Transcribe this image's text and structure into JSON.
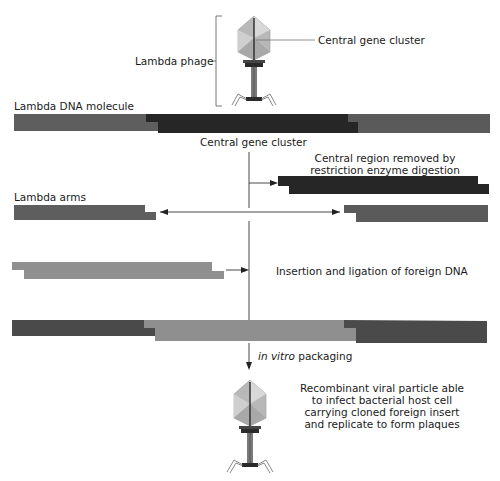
{
  "colors": {
    "arm": "#5a5a5a",
    "central": "#262626",
    "foreign": "#8f8f8f",
    "line": "#333333",
    "phage_head": "#b5b5b5",
    "phage_head_light": "#d6d6d6",
    "phage_dark": "#2a2a2a"
  },
  "labels": {
    "lambda_phage": "Lambda phage",
    "central_gene_cluster_top": "Central gene cluster",
    "lambda_dna_molecule": "Lambda DNA molecule",
    "central_gene_cluster_below": "Central gene cluster",
    "central_region_removed_line1": "Central region removed by",
    "central_region_removed_line2": "restriction enzyme digestion",
    "lambda_arms": "Lambda arms",
    "insertion_ligation": "Insertion and ligation of foreign DNA",
    "in_vitro": "in vitro",
    "packaging": " packaging",
    "recombinant_line1": "Recombinant viral particle able",
    "recombinant_line2": "to infect bacterial host cell",
    "recombinant_line3": "carrying cloned foreign insert",
    "recombinant_line4": "and replicate to form plaques"
  },
  "steps": [
    "Lambda DNA molecule",
    "Central region removed by restriction enzyme digestion",
    "Lambda arms",
    "Insertion and ligation of foreign DNA",
    "in vitro packaging",
    "Recombinant viral particle"
  ]
}
